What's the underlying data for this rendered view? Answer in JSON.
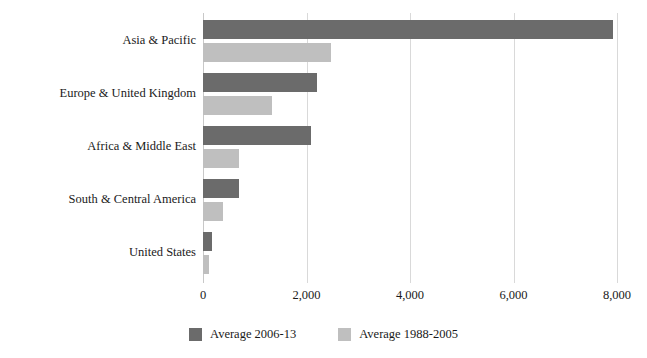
{
  "chart_data": {
    "type": "bar",
    "orientation": "horizontal",
    "title": "",
    "xlabel": "",
    "ylabel": "",
    "xlim": [
      0,
      8000
    ],
    "grid": true,
    "grid_axis": "x",
    "legend_position": "bottom-center",
    "categories": [
      "Asia & Pacific",
      "Europe & United Kingdom",
      "Africa & Middle East",
      "South & Central America",
      "United States"
    ],
    "xticks": [
      0,
      2000,
      4000,
      6000,
      8000
    ],
    "xtick_labels": [
      "0",
      "2,000",
      "4,000",
      "6,000",
      "8,000"
    ],
    "series": [
      {
        "name": "Average 2006-13",
        "color": "#6b6b6b",
        "values": [
          7930,
          2200,
          2090,
          700,
          180
        ]
      },
      {
        "name": "Average 1988-2005",
        "color": "#bfbfbf",
        "values": [
          2480,
          1340,
          700,
          380,
          110
        ]
      }
    ]
  },
  "legend": {
    "items": [
      {
        "label": "Average 2006-13",
        "color": "#6b6b6b"
      },
      {
        "label": "Average 1988-2005",
        "color": "#bfbfbf"
      }
    ]
  }
}
